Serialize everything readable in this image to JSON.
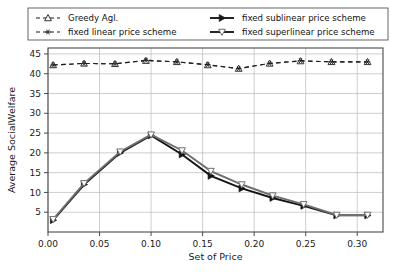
{
  "chart_data": {
    "type": "line",
    "title": "",
    "xlabel": "Set of Price",
    "ylabel": "Average SocialWelfare",
    "xlim": [
      0.0,
      0.325
    ],
    "ylim": [
      0.0,
      46.5
    ],
    "xticks": [
      0.0,
      0.05,
      0.1,
      0.15,
      0.2,
      0.25,
      0.3
    ],
    "xticklabels": [
      "0.00",
      "0.05",
      "0.10",
      "0.15",
      "0.20",
      "0.25",
      "0.30"
    ],
    "yticks": [
      5,
      10,
      15,
      20,
      25,
      30,
      35,
      40,
      45
    ],
    "yticklabels": [
      "5",
      "10",
      "15",
      "20",
      "25",
      "30",
      "35",
      "40",
      "45"
    ],
    "grid": true,
    "legend_position": "above-axes",
    "series": [
      {
        "name": "Greedy Agl.",
        "marker": "triangle-up",
        "linestyle": "dashed",
        "color": "#202020",
        "x": [
          0.005,
          0.035,
          0.065,
          0.095,
          0.125,
          0.155,
          0.185,
          0.215,
          0.245,
          0.275,
          0.31
        ],
        "values": [
          42.2,
          42.6,
          42.5,
          43.3,
          43.0,
          42.2,
          41.3,
          42.6,
          43.2,
          43.0,
          43.0
        ]
      },
      {
        "name": "fixed linear price scheme",
        "marker": "asterisk",
        "linestyle": "dashed",
        "color": "#202020",
        "x": [
          0.005,
          0.035,
          0.065,
          0.095,
          0.125,
          0.155,
          0.185,
          0.215,
          0.245,
          0.275,
          0.31
        ],
        "values": [
          42.2,
          42.6,
          42.5,
          43.4,
          43.0,
          42.3,
          41.3,
          42.6,
          43.3,
          43.0,
          43.0
        ]
      },
      {
        "name": "fixed sublinear price scheme",
        "marker": "triangle-right",
        "linestyle": "solid",
        "color": "#151515",
        "x": [
          0.005,
          0.035,
          0.07,
          0.1,
          0.13,
          0.158,
          0.188,
          0.218,
          0.248,
          0.28,
          0.31
        ],
        "values": [
          3.0,
          12.0,
          20.0,
          24.4,
          19.6,
          14.2,
          11.0,
          8.6,
          6.6,
          4.2,
          4.2
        ]
      },
      {
        "name": "fixed superlinear price scheme",
        "marker": "triangle-down",
        "linestyle": "solid",
        "color": "#6e6e6e",
        "x": [
          0.005,
          0.035,
          0.07,
          0.1,
          0.13,
          0.158,
          0.188,
          0.218,
          0.248,
          0.28,
          0.31
        ],
        "values": [
          3.2,
          12.3,
          20.3,
          24.6,
          20.6,
          15.4,
          12.0,
          9.2,
          7.0,
          4.3,
          4.3
        ]
      }
    ]
  },
  "legend": {
    "entries": [
      {
        "label": "Greedy Agl.",
        "marker": "triangle-up",
        "style": "dashed"
      },
      {
        "label": "fixed sublinear price scheme",
        "marker": "triangle-right",
        "style": "solid"
      },
      {
        "label": "fixed linear price scheme",
        "marker": "asterisk",
        "style": "dashed"
      },
      {
        "label": "fixed superlinear price scheme",
        "marker": "triangle-down",
        "style": "solid"
      }
    ]
  },
  "colors": {
    "background": "#ffffff",
    "grid": "#b9b9b9",
    "frame": "#4a4a4a",
    "dark_series": "#202020",
    "gray_series": "#6e6e6e"
  }
}
